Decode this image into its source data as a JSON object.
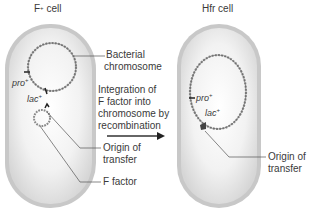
{
  "title_left": {
    "text": "F",
    "sup": "+",
    "rest": " cell"
  },
  "title_right": "Hfr cell",
  "left_cell": {
    "labels": {
      "bacterial_chromosome_1": "Bacterial",
      "bacterial_chromosome_2": "chromosome",
      "origin_of_transfer_1": "Origin of",
      "origin_of_transfer_2": "transfer",
      "f_factor": "F factor"
    },
    "genes": {
      "pro": {
        "name": "pro",
        "sup": "+"
      },
      "lac": {
        "name": "lac",
        "sup": "+"
      }
    }
  },
  "process": {
    "lines": [
      "Integration of",
      "F factor into",
      "chromosome by",
      "recombination"
    ],
    "arrow": "right-arrow"
  },
  "right_cell": {
    "labels": {
      "origin_of_transfer_1": "Origin of",
      "origin_of_transfer_2": "transfer"
    },
    "genes": {
      "pro": {
        "name": "pro",
        "sup": "+"
      },
      "lac": {
        "name": "lac",
        "sup": "+"
      }
    }
  },
  "colors": {
    "cell_wall": "#bdbdbd",
    "cell_inner": "#e2e2e2",
    "cytoplasm_light": "#f7f7f7",
    "dna": "#777777",
    "leader_line": "#555555",
    "text": "#3a3a3a"
  }
}
